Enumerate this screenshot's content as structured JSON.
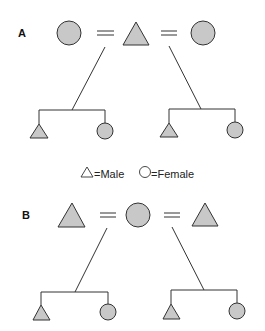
{
  "figure": {
    "panels": [
      {
        "label": "A",
        "description": "One male married to two females (polygyny)",
        "spouses": [
          "female",
          "male",
          "female"
        ],
        "children_left": [
          "male",
          "female"
        ],
        "children_right": [
          "male",
          "female"
        ]
      },
      {
        "label": "B",
        "description": "One female married to two males (polyandry)",
        "spouses": [
          "male",
          "female",
          "male"
        ],
        "children_left": [
          "male",
          "female"
        ],
        "children_right": [
          "male",
          "female"
        ]
      }
    ],
    "legend": {
      "male_symbol": "triangle-icon",
      "male_text": "=Male",
      "female_symbol": "circle-icon",
      "female_text": "=Female"
    },
    "colors": {
      "fill": "#c8c8c8",
      "stroke": "#333333",
      "background": "#ffffff"
    }
  }
}
